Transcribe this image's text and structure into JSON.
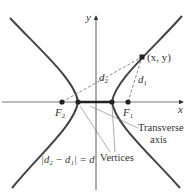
{
  "diagram": {
    "axes": {
      "x_label": "x",
      "y_label": "y"
    },
    "point": {
      "label": "(x, y)"
    },
    "foci": [
      {
        "name": "F",
        "sub": "2"
      },
      {
        "name": "F",
        "sub": "1"
      }
    ],
    "distances": [
      {
        "name": "d",
        "sub": "2"
      },
      {
        "name": "d",
        "sub": "1"
      }
    ],
    "annotations": {
      "transverse_axis_line1": "Transverse",
      "transverse_axis_line2": "axis",
      "vertices": "Vertices",
      "equation": "|d₂ − d₁| = d"
    },
    "colors": {
      "curve": "#333333",
      "axis": "#333333",
      "dashed": "#555555",
      "text": "#333333"
    }
  }
}
